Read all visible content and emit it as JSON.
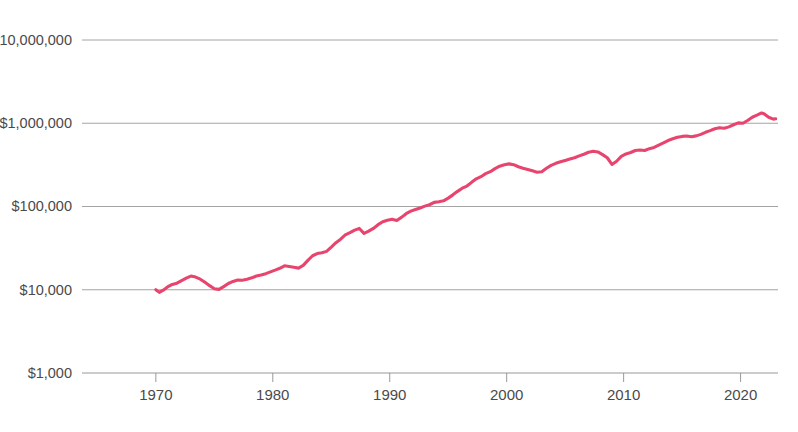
{
  "chart_data": {
    "type": "line",
    "title": "",
    "subtitle": "",
    "xlabel": "",
    "ylabel": "",
    "yscale": "log",
    "ylim": [
      1000,
      10000000
    ],
    "xlim": [
      1969.5,
      2023.2
    ],
    "grid": true,
    "legend": "none",
    "accent_color": "#E8456E",
    "gridline_color": "#9a9a9a",
    "label_color": "#4a4a4a",
    "y_ticks": [
      {
        "value": 10000000,
        "label": "$10,000,000"
      },
      {
        "value": 1000000,
        "label": "$1,000,000"
      },
      {
        "value": 100000,
        "label": "$100,000"
      },
      {
        "value": 10000,
        "label": "$10,000"
      },
      {
        "value": 1000,
        "label": "$1,000"
      }
    ],
    "x_ticks": [
      {
        "value": 1970,
        "label": "1970"
      },
      {
        "value": 1980,
        "label": "1980"
      },
      {
        "value": 1990,
        "label": "1990"
      },
      {
        "value": 2000,
        "label": "2000"
      },
      {
        "value": 2010,
        "label": "2010"
      },
      {
        "value": 2020,
        "label": "2020"
      }
    ],
    "series": [
      {
        "name": "Growth of $10,000",
        "color": "#E8456E",
        "x": [
          1970.0,
          1970.3,
          1970.6,
          1971.0,
          1971.4,
          1971.8,
          1972.2,
          1972.6,
          1973.0,
          1973.4,
          1973.8,
          1974.2,
          1974.6,
          1975.0,
          1975.4,
          1975.8,
          1976.2,
          1976.6,
          1977.0,
          1977.4,
          1977.8,
          1978.2,
          1978.6,
          1979.0,
          1979.4,
          1979.8,
          1980.2,
          1980.6,
          1981.0,
          1981.4,
          1981.8,
          1982.2,
          1982.6,
          1983.0,
          1983.4,
          1983.8,
          1984.2,
          1984.6,
          1985.0,
          1985.4,
          1985.8,
          1986.2,
          1986.6,
          1987.0,
          1987.4,
          1987.8,
          1988.2,
          1988.6,
          1989.0,
          1989.4,
          1989.8,
          1990.2,
          1990.6,
          1991.0,
          1991.4,
          1991.8,
          1992.2,
          1992.6,
          1993.0,
          1993.4,
          1993.8,
          1994.2,
          1994.6,
          1995.0,
          1995.4,
          1995.8,
          1996.2,
          1996.6,
          1997.0,
          1997.4,
          1997.8,
          1998.2,
          1998.6,
          1999.0,
          1999.4,
          1999.8,
          2000.2,
          2000.6,
          2001.0,
          2001.4,
          2001.8,
          2002.2,
          2002.6,
          2003.0,
          2003.4,
          2003.8,
          2004.2,
          2004.6,
          2005.0,
          2005.4,
          2005.8,
          2006.2,
          2006.6,
          2007.0,
          2007.4,
          2007.8,
          2008.2,
          2008.6,
          2009.0,
          2009.4,
          2009.8,
          2010.2,
          2010.6,
          2011.0,
          2011.4,
          2011.8,
          2012.2,
          2012.6,
          2013.0,
          2013.4,
          2013.8,
          2014.2,
          2014.6,
          2015.0,
          2015.4,
          2015.8,
          2016.2,
          2016.6,
          2017.0,
          2017.4,
          2017.8,
          2018.2,
          2018.6,
          2019.0,
          2019.4,
          2019.8,
          2020.2,
          2020.6,
          2021.0,
          2021.4,
          2021.8,
          2022.0,
          2022.4,
          2022.8,
          2023.0
        ],
        "y": [
          10000,
          9300,
          9800,
          10800,
          11600,
          12000,
          12900,
          13800,
          14600,
          14200,
          13400,
          12300,
          11200,
          10300,
          10100,
          10900,
          11900,
          12600,
          13100,
          13000,
          13400,
          13900,
          14600,
          15000,
          15600,
          16400,
          17200,
          18100,
          19400,
          19000,
          18600,
          18200,
          19600,
          22500,
          25600,
          27200,
          27800,
          28900,
          32500,
          36800,
          40500,
          45500,
          48500,
          52000,
          54500,
          47500,
          50500,
          54500,
          60500,
          65500,
          68500,
          70500,
          68000,
          74000,
          82000,
          88000,
          92000,
          96000,
          101000,
          105000,
          112000,
          114000,
          117000,
          126000,
          138000,
          152000,
          166000,
          176000,
          195000,
          215000,
          228000,
          248000,
          262000,
          285000,
          305000,
          318000,
          325000,
          318000,
          300000,
          288000,
          278000,
          268000,
          258000,
          262000,
          288000,
          312000,
          330000,
          345000,
          358000,
          372000,
          385000,
          405000,
          425000,
          448000,
          460000,
          452000,
          420000,
          385000,
          320000,
          350000,
          400000,
          428000,
          445000,
          470000,
          478000,
          470000,
          495000,
          512000,
          545000,
          580000,
          620000,
          650000,
          678000,
          695000,
          702000,
          690000,
          705000,
          735000,
          778000,
          815000,
          860000,
          885000,
          870000,
          905000,
          960000,
          1010000,
          1000000,
          1080000,
          1180000,
          1250000,
          1330000,
          1300000,
          1180000,
          1120000,
          1130000
        ]
      }
    ]
  },
  "axes": {
    "plot_left": 150,
    "plot_right": 778,
    "grid_left": 82,
    "plot_top": 40,
    "plot_bottom": 373
  }
}
